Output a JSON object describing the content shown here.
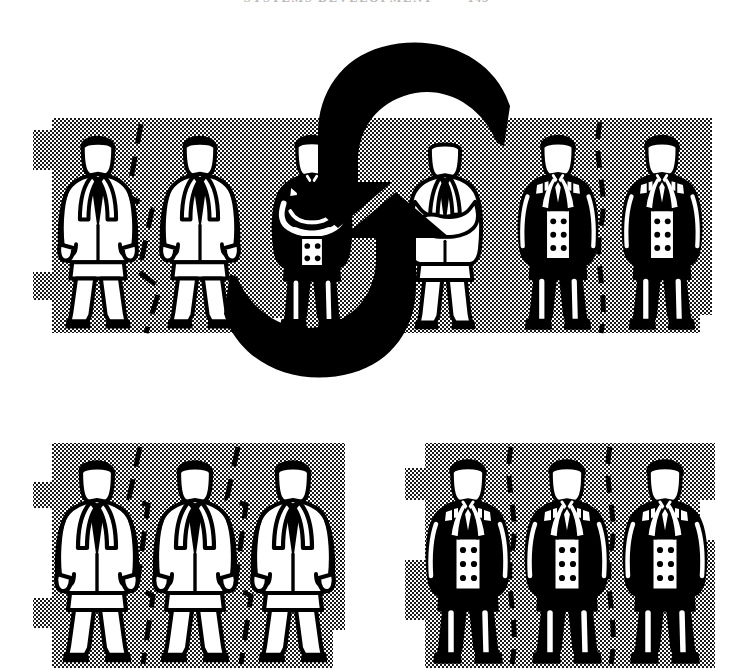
{
  "page": {
    "width": 733,
    "height": 672,
    "background_color": "#ffffff",
    "ink_color": "#000000",
    "halftone_color": "#1a1a1a",
    "running_head": "SYSTEMS DEVELOPMENT",
    "running_head_page_number": "145"
  },
  "figure": {
    "name": "exchange-cycle-illustration",
    "style": "high-contrast black and white line art with halftone dot shading",
    "panels": [
      {
        "id": "top-panel",
        "name": "top-exchange-row",
        "x": 33,
        "y": 118,
        "width": 679,
        "height": 215,
        "shading": "halftone",
        "figures": [
          {
            "id": "t1",
            "suit": "light",
            "pose": "arms-at-side",
            "x": 60,
            "y": 126,
            "height": 205
          },
          {
            "id": "t2",
            "suit": "light",
            "pose": "arms-at-side",
            "x": 160,
            "y": 126,
            "height": 205
          },
          {
            "id": "t3",
            "suit": "dark",
            "pose": "arms-crossed",
            "x": 275,
            "y": 130,
            "height": 200
          },
          {
            "id": "t4",
            "suit": "light",
            "pose": "arms-crossed",
            "x": 408,
            "y": 130,
            "height": 200
          },
          {
            "id": "t5",
            "suit": "dark",
            "pose": "arms-at-side",
            "x": 520,
            "y": 126,
            "height": 205
          },
          {
            "id": "t6",
            "suit": "dark",
            "pose": "arms-at-side",
            "x": 625,
            "y": 126,
            "height": 205
          }
        ],
        "dividers": [
          {
            "style": "zigzag-dashed",
            "x": 135
          },
          {
            "style": "wavy-dashed",
            "x": 600
          }
        ]
      },
      {
        "id": "bottom-left-panel",
        "name": "light-suit-group",
        "x": 33,
        "y": 443,
        "width": 312,
        "height": 225,
        "shading": "halftone",
        "figures": [
          {
            "id": "bl1",
            "suit": "light",
            "pose": "arms-at-side",
            "x": 58,
            "y": 450,
            "height": 215
          },
          {
            "id": "bl2",
            "suit": "light",
            "pose": "arms-at-side",
            "x": 155,
            "y": 450,
            "height": 215
          },
          {
            "id": "bl3",
            "suit": "light",
            "pose": "arms-at-side",
            "x": 253,
            "y": 450,
            "height": 215
          }
        ],
        "dividers": [
          {
            "style": "zigzag-dashed",
            "x": 135
          },
          {
            "style": "zigzag-dashed",
            "x": 232
          }
        ]
      },
      {
        "id": "bottom-right-panel",
        "name": "dark-suit-group",
        "x": 405,
        "y": 443,
        "width": 310,
        "height": 225,
        "shading": "halftone",
        "figures": [
          {
            "id": "br1",
            "suit": "dark",
            "pose": "arms-at-side",
            "x": 428,
            "y": 450,
            "height": 215
          },
          {
            "id": "br2",
            "suit": "dark",
            "pose": "arms-at-side",
            "x": 527,
            "y": 450,
            "height": 215
          },
          {
            "id": "br3",
            "suit": "dark",
            "pose": "arms-at-side",
            "x": 625,
            "y": 450,
            "height": 215
          }
        ],
        "dividers": [
          {
            "style": "wavy-dashed",
            "x": 508
          },
          {
            "style": "wavy-dashed",
            "x": 607
          }
        ]
      }
    ],
    "arrows": [
      {
        "id": "arrow-top",
        "name": "arrow-right-to-left",
        "direction": "right-to-left",
        "head_position": "lower-left",
        "color": "#000000"
      },
      {
        "id": "arrow-bottom",
        "name": "arrow-left-to-right",
        "direction": "left-to-right",
        "head_position": "upper-right",
        "color": "#000000"
      }
    ]
  }
}
